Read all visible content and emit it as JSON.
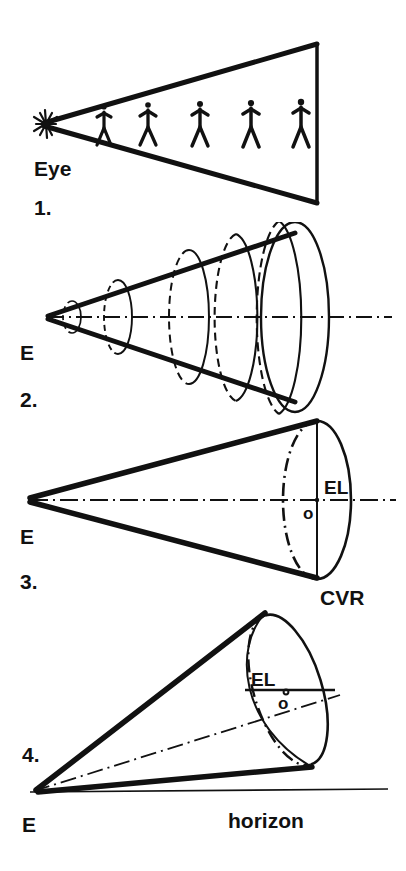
{
  "figure": {
    "ink_color": "#111111",
    "background": "#ffffff",
    "width": 406,
    "height": 871
  },
  "panels": [
    {
      "number": "1.",
      "caption_eye": "Eye",
      "description": "Plan view: triangular cone of vision containing five standing figures",
      "figure_count": 5,
      "apex_marker": "starburst-eye-point"
    },
    {
      "number": "2.",
      "caption_eye": "E",
      "description": "Cone of vision shown as a 3D cone with five successive circular sections",
      "section_count": 5,
      "axis": "centerline"
    },
    {
      "number": "3.",
      "caption_eye": "E",
      "description": "Single cone with circular base; eye level line and station point marked",
      "labels": {
        "eye_level": "EL",
        "center_point": "o",
        "base_plane": "CVR"
      }
    },
    {
      "number": "4.",
      "caption_eye": "E",
      "description": "Tilted cone of vision above the horizon line",
      "labels": {
        "eye_level": "EL",
        "center_point": "o",
        "ground_line": "horizon"
      }
    }
  ],
  "legend": {
    "eye_full": "Eye",
    "eye_short": "E",
    "eye_level": "EL",
    "center_of_vision": "o",
    "cone_of_vision_radius": "CVR",
    "horizon": "horizon",
    "n1": "1.",
    "n2": "2.",
    "n3": "3.",
    "n4": "4."
  }
}
